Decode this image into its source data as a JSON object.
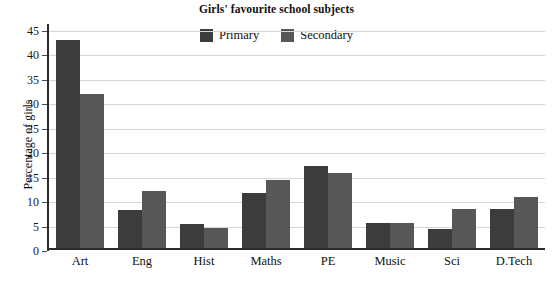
{
  "chart_data": {
    "type": "bar",
    "title": "Girls' favourite school subjects",
    "xlabel": "",
    "ylabel": "Percentage of girls",
    "categories": [
      "Art",
      "Eng",
      "Hist",
      "Maths",
      "PE",
      "Music",
      "Sci",
      "D.Tech"
    ],
    "series": [
      {
        "name": "Primary",
        "color": "#3c3c3c",
        "values": [
          42.5,
          7.8,
          5.0,
          11.2,
          16.7,
          5.2,
          3.8,
          8.0
        ]
      },
      {
        "name": "Secondary",
        "color": "#575757",
        "values": [
          31.5,
          11.6,
          4.1,
          14.0,
          15.3,
          5.2,
          8.0,
          10.5
        ]
      }
    ],
    "ylim": [
      0,
      46
    ],
    "yticks": [
      0,
      5,
      10,
      15,
      20,
      25,
      30,
      35,
      40,
      45
    ],
    "ytick_labels": [
      "0",
      "5",
      "10",
      "15",
      "20",
      "25",
      "30",
      "35",
      "40",
      "45"
    ],
    "grid": true,
    "legend_position": "top-center",
    "axis_color": "#2b2b2b",
    "grid_color": "#d5d5d5",
    "background": "#ffffff"
  }
}
